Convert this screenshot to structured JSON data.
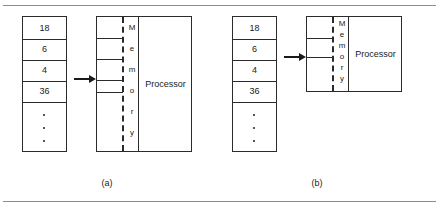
{
  "figure": {
    "width": 439,
    "height": 213,
    "background": "#ffffff",
    "line_color": "#2b2b2b",
    "rule_color": "#8b8b8b",
    "text_color": "#1a1a1a"
  },
  "panels": [
    {
      "id": "a",
      "caption": "(a)",
      "stack": {
        "name": "stack-a",
        "values": [
          "18",
          "6",
          "4",
          "36"
        ],
        "ellipsis_dots": 3
      },
      "arrow": {
        "name": "arrow-a",
        "direction": "right"
      },
      "memory": {
        "name": "memory-a",
        "label": "Memory",
        "letters": [
          "M",
          "e",
          "m",
          "o",
          "r",
          "y"
        ],
        "cell_dividers": 5,
        "boundary_style": "dashed"
      },
      "processor": {
        "name": "processor-a",
        "label": "Processor"
      }
    },
    {
      "id": "b",
      "caption": "(b)",
      "stack": {
        "name": "stack-b",
        "values": [
          "18",
          "6",
          "4",
          "36"
        ],
        "ellipsis_dots": 3
      },
      "arrow": {
        "name": "arrow-b",
        "direction": "right"
      },
      "memory": {
        "name": "memory-b",
        "label": "Memory",
        "letters": [
          "M",
          "e",
          "m",
          "o",
          "r",
          "y"
        ],
        "cell_dividers": 2,
        "boundary_style": "dashed"
      },
      "processor": {
        "name": "processor-b",
        "label": "Processor"
      }
    }
  ]
}
